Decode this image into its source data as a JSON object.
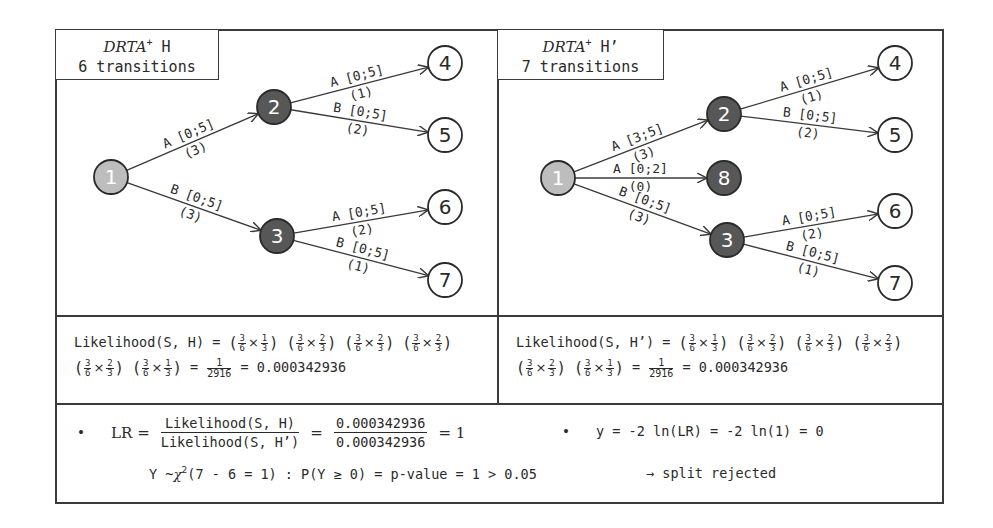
{
  "colors": {
    "border": "#3a3a3a",
    "start_node": "#bdbdbd",
    "internal_node": "#575757",
    "leaf_node": "#ffffff",
    "edge": "#3a3a3a"
  },
  "left_panel": {
    "title_italic": "DRTA",
    "title_sup": "+",
    "title_rest": " H",
    "subtitle": "6 transitions",
    "nodes": [
      {
        "id": "1",
        "type": "start",
        "x": 111,
        "y": 177
      },
      {
        "id": "2",
        "type": "internal",
        "x": 274,
        "y": 107
      },
      {
        "id": "3",
        "type": "internal",
        "x": 277,
        "y": 236
      },
      {
        "id": "4",
        "type": "leaf",
        "x": 445,
        "y": 63
      },
      {
        "id": "5",
        "type": "leaf",
        "x": 445,
        "y": 135
      },
      {
        "id": "6",
        "type": "leaf",
        "x": 445,
        "y": 207
      },
      {
        "id": "7",
        "type": "leaf",
        "x": 445,
        "y": 280
      }
    ],
    "edges": [
      {
        "from": "1",
        "to": "2",
        "label": "A [0;5]",
        "count": "(3)"
      },
      {
        "from": "1",
        "to": "3",
        "label": "B [0;5]",
        "count": "(3)"
      },
      {
        "from": "2",
        "to": "4",
        "label": "A [0;5]",
        "count": "(1)"
      },
      {
        "from": "2",
        "to": "5",
        "label": "B [0;5]",
        "count": "(2)"
      },
      {
        "from": "3",
        "to": "6",
        "label": "A [0;5]",
        "count": "(2)"
      },
      {
        "from": "3",
        "to": "7",
        "label": "B [0;5]",
        "count": "(1)"
      }
    ],
    "likelihood_label": "Likelihood(S, H) =",
    "likelihood_factors": [
      {
        "a_num": "3",
        "a_den": "6",
        "b_num": "1",
        "b_den": "3"
      },
      {
        "a_num": "3",
        "a_den": "6",
        "b_num": "2",
        "b_den": "3"
      },
      {
        "a_num": "3",
        "a_den": "6",
        "b_num": "2",
        "b_den": "3"
      },
      {
        "a_num": "3",
        "a_den": "6",
        "b_num": "2",
        "b_den": "3"
      },
      {
        "a_num": "3",
        "a_den": "6",
        "b_num": "2",
        "b_den": "3"
      },
      {
        "a_num": "3",
        "a_den": "6",
        "b_num": "1",
        "b_den": "3"
      }
    ],
    "result_frac_num": "1",
    "result_frac_den": "2916",
    "result_value": "0.000342936"
  },
  "right_panel": {
    "title_italic": "DRTA",
    "title_sup": "+",
    "title_rest": " H’",
    "subtitle": "7 transitions",
    "nodes": [
      {
        "id": "1",
        "type": "start",
        "x": 558,
        "y": 178
      },
      {
        "id": "2",
        "type": "internal",
        "x": 724,
        "y": 114
      },
      {
        "id": "8",
        "type": "internal",
        "x": 724,
        "y": 178
      },
      {
        "id": "3",
        "type": "internal",
        "x": 727,
        "y": 240
      },
      {
        "id": "4",
        "type": "leaf",
        "x": 895,
        "y": 63
      },
      {
        "id": "5",
        "type": "leaf",
        "x": 895,
        "y": 135
      },
      {
        "id": "6",
        "type": "leaf",
        "x": 895,
        "y": 211
      },
      {
        "id": "7",
        "type": "leaf",
        "x": 895,
        "y": 283
      }
    ],
    "edges": [
      {
        "from": "1",
        "to": "2",
        "label": "A [3;5]",
        "count": "(3)"
      },
      {
        "from": "1",
        "to": "8",
        "label": "A [0;2]",
        "count": "(0)"
      },
      {
        "from": "1",
        "to": "3",
        "label": "B [0;5]",
        "count": "(3)"
      },
      {
        "from": "2",
        "to": "4",
        "label": "A [0;5]",
        "count": "(1)"
      },
      {
        "from": "2",
        "to": "5",
        "label": "B [0;5]",
        "count": "(2)"
      },
      {
        "from": "3",
        "to": "6",
        "label": "A [0;5]",
        "count": "(2)"
      },
      {
        "from": "3",
        "to": "7",
        "label": "B [0;5]",
        "count": "(1)"
      }
    ],
    "likelihood_label": "Likelihood(S, H’) =",
    "likelihood_factors": [
      {
        "a_num": "3",
        "a_den": "6",
        "b_num": "1",
        "b_den": "3"
      },
      {
        "a_num": "3",
        "a_den": "6",
        "b_num": "2",
        "b_den": "3"
      },
      {
        "a_num": "3",
        "a_den": "6",
        "b_num": "2",
        "b_den": "3"
      },
      {
        "a_num": "3",
        "a_den": "6",
        "b_num": "2",
        "b_den": "3"
      },
      {
        "a_num": "3",
        "a_den": "6",
        "b_num": "2",
        "b_den": "3"
      },
      {
        "a_num": "3",
        "a_den": "6",
        "b_num": "1",
        "b_den": "3"
      }
    ],
    "result_frac_num": "1",
    "result_frac_den": "2916",
    "result_value": "0.000342936"
  },
  "bottom": {
    "bullet": "•",
    "lr_label": "LR =",
    "lr_num": "Likelihood(S, H)",
    "lr_den": "Likelihood(S, H’)",
    "lr_eq": "=",
    "lr_val_num": "0.000342936",
    "lr_val_den": "0.000342936",
    "lr_result": "= 1",
    "y_formula": "y = -2 ln(LR) = -2 ln(1) = 0",
    "chi_line_pre": "Y ~",
    "chi_symbol": "χ",
    "chi_sup": "2",
    "chi_args": "(7 - 6 = 1) : P(Y ≥ 0) = p-value = 1 > 0.05",
    "conclusion": "→ split rejected"
  }
}
